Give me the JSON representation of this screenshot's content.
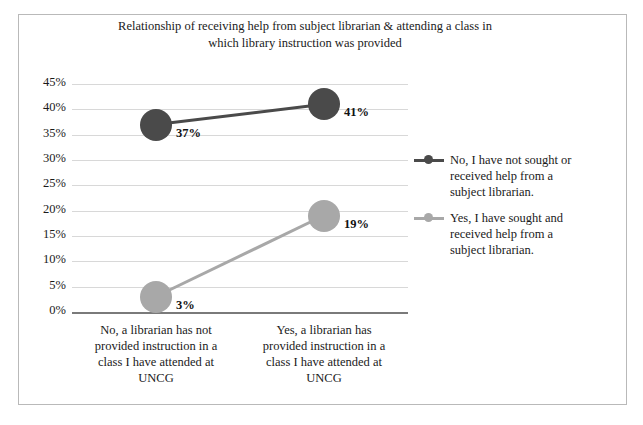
{
  "chart_data": {
    "type": "line",
    "title": "Relationship of receiving help from subject librarian & attending a class in which library instruction was provided",
    "title_lines": [
      "Relationship  of receiving  help from subject  librarian  & attending  a class in",
      "which  library  instruction  was provided"
    ],
    "xlabel": "",
    "ylabel": "",
    "grid": true,
    "legend_position": "right",
    "ylim": [
      0,
      45
    ],
    "ytick_labels": [
      "45%",
      "40%",
      "35%",
      "30%",
      "25%",
      "20%",
      "15%",
      "10%",
      "5%",
      "0%"
    ],
    "ytick_values": [
      45,
      40,
      35,
      30,
      25,
      20,
      15,
      10,
      5,
      0
    ],
    "categories": [
      "No, a librarian has not provided instruction in a class I have attended at UNCG",
      "Yes, a librarian has provided instruction in a class I have attended at UNCG"
    ],
    "category_lines": [
      [
        "No, a librarian has not",
        "provided instruction in a",
        "class I have attended at",
        "UNCG"
      ],
      [
        "Yes, a librarian has",
        "provided instruction in a",
        "class I have attended at",
        "UNCG"
      ]
    ],
    "series": [
      {
        "name": "No, I have not sought or received help from a subject librarian.",
        "name_lines": [
          "No, I have not sought or",
          "received help from a",
          "subject librarian."
        ],
        "color": "#4a4a4a",
        "values": [
          37,
          41
        ],
        "labels": [
          "37%",
          "41%"
        ]
      },
      {
        "name": "Yes, I have sought and received help from a subject librarian.",
        "name_lines": [
          "Yes, I have sought and",
          "received help from a",
          "subject librarian."
        ],
        "color": "#a8a8a8",
        "values": [
          3,
          19
        ],
        "labels": [
          "3%",
          "19%"
        ]
      }
    ]
  },
  "colors": {
    "series_dark": "#4a4a4a",
    "series_light": "#a8a8a8",
    "gridline": "#d8d8d8",
    "axis": "#7a7a7a",
    "frame": "#b9b9b9",
    "text": "#1a1a1a"
  }
}
